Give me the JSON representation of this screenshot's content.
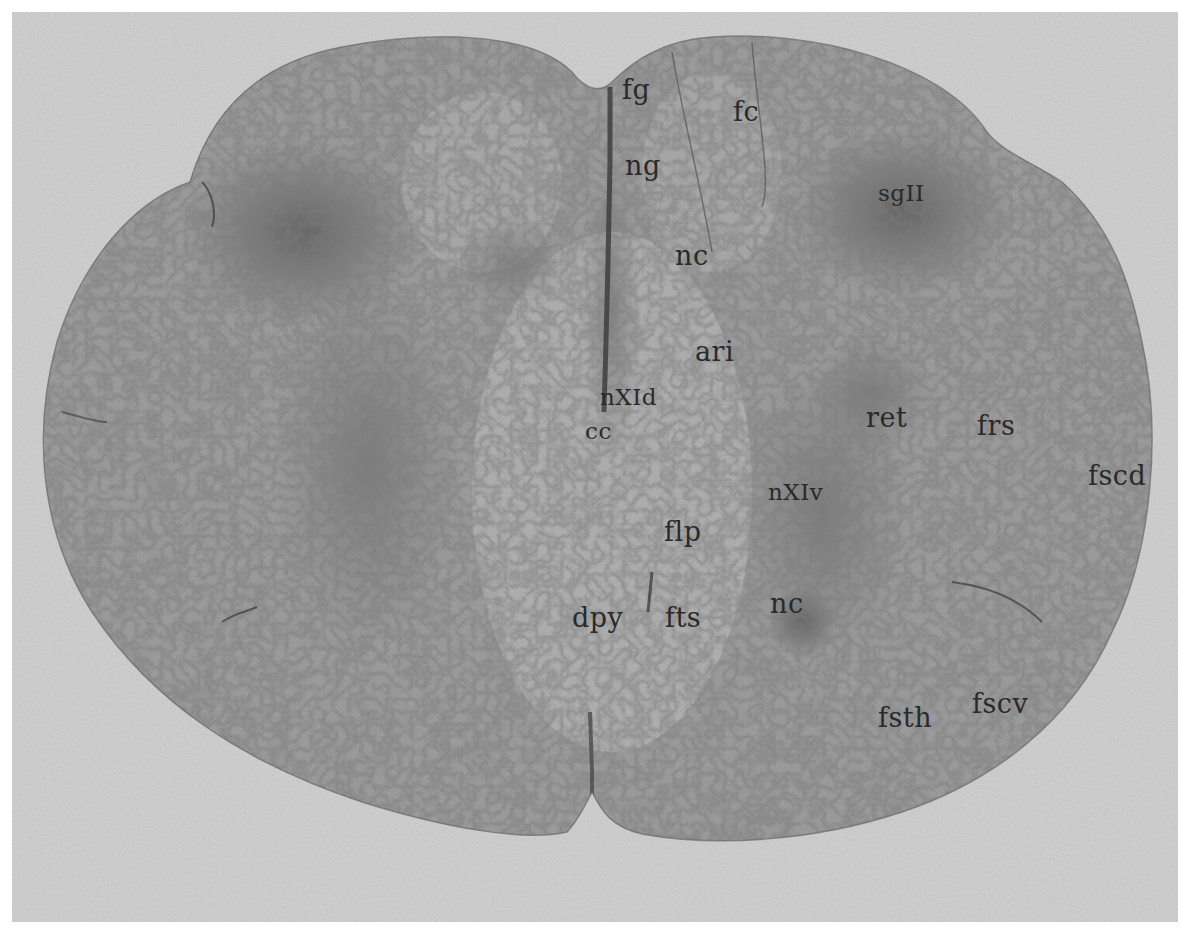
{
  "figure": {
    "colors": {
      "background_border": "#ffffff",
      "slide_background": "#d2d2d2",
      "white_matter": "#9c9c9c",
      "gray_matter_dark": "#5e5e5e",
      "label_text": "#2a2a2a"
    },
    "labels": [
      {
        "id": "fg",
        "text": "fg",
        "x": 622,
        "y": 78
      },
      {
        "id": "fc",
        "text": "fc",
        "x": 733,
        "y": 100
      },
      {
        "id": "ng",
        "text": "ng",
        "x": 625,
        "y": 152
      },
      {
        "id": "sgII",
        "text": "sgII",
        "x": 878,
        "y": 180
      },
      {
        "id": "nc_top",
        "text": "nc",
        "x": 675,
        "y": 243
      },
      {
        "id": "ari",
        "text": "ari",
        "x": 695,
        "y": 338
      },
      {
        "id": "nXId",
        "text": "nXId",
        "x": 600,
        "y": 384
      },
      {
        "id": "cc",
        "text": "cc",
        "x": 585,
        "y": 418
      },
      {
        "id": "ret",
        "text": "ret",
        "x": 866,
        "y": 404
      },
      {
        "id": "frs",
        "text": "frs",
        "x": 977,
        "y": 412
      },
      {
        "id": "fscd",
        "text": "fscd",
        "x": 1088,
        "y": 462
      },
      {
        "id": "nXIv",
        "text": "nXIv",
        "x": 768,
        "y": 479
      },
      {
        "id": "flp",
        "text": "flp",
        "x": 664,
        "y": 516
      },
      {
        "id": "dpy",
        "text": "dpy",
        "x": 572,
        "y": 602
      },
      {
        "id": "fts",
        "text": "fts",
        "x": 665,
        "y": 602
      },
      {
        "id": "nc_bot",
        "text": "nc",
        "x": 770,
        "y": 590
      },
      {
        "id": "fsth",
        "text": "fsth",
        "x": 878,
        "y": 703
      },
      {
        "id": "fscv",
        "text": "fscv",
        "x": 972,
        "y": 690
      }
    ]
  }
}
